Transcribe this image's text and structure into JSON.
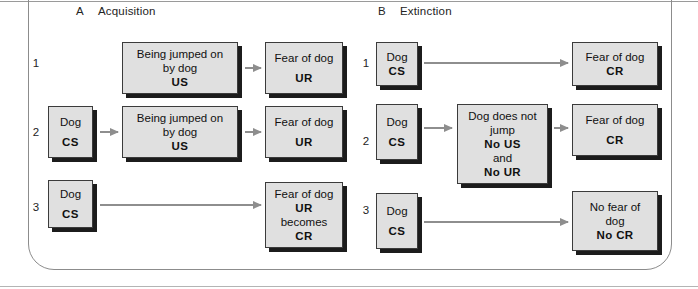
{
  "figure": {
    "width": 698,
    "height": 289,
    "accent_box_fill": "#e0e0e0",
    "accent_box_border": "#3b3b3b",
    "accent_shadow": "#1c1c1c",
    "accent_arrow": "#8e8e8e",
    "frame_color": "#8c8c8c"
  },
  "panels": [
    {
      "letter": "A",
      "title": "Acquisition",
      "rows": [
        {
          "number": "1",
          "nodes": [
            {
              "lines": [
                "Being jumped on",
                "by dog",
                "US"
              ],
              "bold": [
                false,
                false,
                true
              ]
            },
            {
              "lines": [
                "Fear of dog",
                "",
                "UR"
              ],
              "bold": [
                false,
                false,
                true
              ]
            }
          ]
        },
        {
          "number": "2",
          "nodes": [
            {
              "lines": [
                "Dog",
                "",
                "CS"
              ],
              "bold": [
                false,
                false,
                true
              ]
            },
            {
              "lines": [
                "Being jumped on",
                "by dog",
                "US"
              ],
              "bold": [
                false,
                false,
                true
              ]
            },
            {
              "lines": [
                "Fear of dog",
                "",
                "UR"
              ],
              "bold": [
                false,
                false,
                true
              ]
            }
          ]
        },
        {
          "number": "3",
          "nodes": [
            {
              "lines": [
                "Dog",
                "",
                "CS"
              ],
              "bold": [
                false,
                false,
                true
              ]
            },
            {
              "lines": [
                "Fear of dog",
                "UR",
                "becomes",
                "CR"
              ],
              "bold": [
                false,
                true,
                false,
                true
              ]
            }
          ]
        }
      ]
    },
    {
      "letter": "B",
      "title": "Extinction",
      "rows": [
        {
          "number": "1",
          "nodes": [
            {
              "lines": [
                "Dog",
                "CS"
              ],
              "bold": [
                false,
                true
              ]
            },
            {
              "lines": [
                "Fear of dog",
                "CR"
              ],
              "bold": [
                false,
                true
              ]
            }
          ]
        },
        {
          "number": "2",
          "nodes": [
            {
              "lines": [
                "Dog",
                "",
                "CS"
              ],
              "bold": [
                false,
                false,
                true
              ]
            },
            {
              "lines": [
                "Dog does not",
                "jump",
                "No US",
                "and",
                "No UR"
              ],
              "bold": [
                false,
                false,
                true,
                false,
                true
              ]
            },
            {
              "lines": [
                "Fear of dog",
                "",
                "CR"
              ],
              "bold": [
                false,
                false,
                true
              ]
            }
          ]
        },
        {
          "number": "3",
          "nodes": [
            {
              "lines": [
                "Dog",
                "",
                "CS"
              ],
              "bold": [
                false,
                false,
                true
              ]
            },
            {
              "lines": [
                "No fear of",
                "dog",
                "No CR"
              ],
              "bold": [
                false,
                false,
                true
              ]
            }
          ]
        }
      ]
    }
  ],
  "labels": {
    "panel_a_letter": "A",
    "panel_a_title": "Acquisition",
    "panel_b_letter": "B",
    "panel_b_title": "Extinction",
    "a_row1_num": "1",
    "a_row2_num": "2",
    "a_row3_num": "3",
    "b_row1_num": "1",
    "b_row2_num": "2",
    "b_row3_num": "3",
    "a_r1_n1_l1": "Being jumped on",
    "a_r1_n1_l2": "by dog",
    "a_r1_n1_l3": "US",
    "a_r1_n2_l1": "Fear of dog",
    "a_r1_n2_l2": "UR",
    "a_r2_n1_l1": "Dog",
    "a_r2_n1_l2": "CS",
    "a_r2_n2_l1": "Being jumped on",
    "a_r2_n2_l2": "by dog",
    "a_r2_n2_l3": "US",
    "a_r2_n3_l1": "Fear of dog",
    "a_r2_n3_l2": "UR",
    "a_r3_n1_l1": "Dog",
    "a_r3_n1_l2": "CS",
    "a_r3_n2_l1": "Fear of dog",
    "a_r3_n2_l2": "UR",
    "a_r3_n2_l3": "becomes",
    "a_r3_n2_l4": "CR",
    "b_r1_n1_l1": "Dog",
    "b_r1_n1_l2": "CS",
    "b_r1_n2_l1": "Fear of dog",
    "b_r1_n2_l2": "CR",
    "b_r2_n1_l1": "Dog",
    "b_r2_n1_l2": "CS",
    "b_r2_n2_l1": "Dog does not",
    "b_r2_n2_l2": "jump",
    "b_r2_n2_l3": "No US",
    "b_r2_n2_l4": "and",
    "b_r2_n2_l5": "No UR",
    "b_r2_n3_l1": "Fear of dog",
    "b_r2_n3_l2": "CR",
    "b_r3_n1_l1": "Dog",
    "b_r3_n1_l2": "CS",
    "b_r3_n2_l1": "No fear of",
    "b_r3_n2_l2": "dog",
    "b_r3_n2_l3": "No CR"
  }
}
